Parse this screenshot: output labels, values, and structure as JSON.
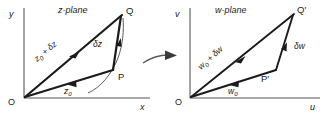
{
  "figure": {
    "panels": [
      {
        "id": "z-plane",
        "title": "z-plane",
        "axes": {
          "vertical_label": "y",
          "horizontal_label": "x",
          "origin_label": "O"
        },
        "points": [
          {
            "name": "P",
            "label": "P"
          },
          {
            "name": "Q",
            "label": "Q"
          }
        ],
        "vectors": [
          {
            "name": "z0",
            "label": "z",
            "subscript": "0"
          },
          {
            "name": "z0-plus-dz",
            "label": "z",
            "subscript": "0",
            "suffix": " + δz"
          },
          {
            "name": "dz",
            "label": "δz"
          }
        ]
      },
      {
        "id": "w-plane",
        "title": "w-plane",
        "axes": {
          "vertical_label": "v",
          "horizontal_label": "u",
          "origin_label": "O"
        },
        "points": [
          {
            "name": "P-prime",
            "label": "P′"
          },
          {
            "name": "Q-prime",
            "label": "Q′"
          }
        ],
        "vectors": [
          {
            "name": "w0",
            "label": "w",
            "subscript": "0"
          },
          {
            "name": "w0-plus-dw",
            "label": "w",
            "subscript": "0",
            "suffix": " + δw"
          },
          {
            "name": "dw",
            "label": "δw"
          }
        ]
      }
    ],
    "transition": {
      "name": "mapping-arrow",
      "label": ""
    },
    "colors": {
      "background": "#ffffff",
      "axis": "#8c8c8c",
      "vector": "#1b1b1b",
      "curve": "#4a4a4a",
      "text": "#1b1b1b"
    }
  }
}
